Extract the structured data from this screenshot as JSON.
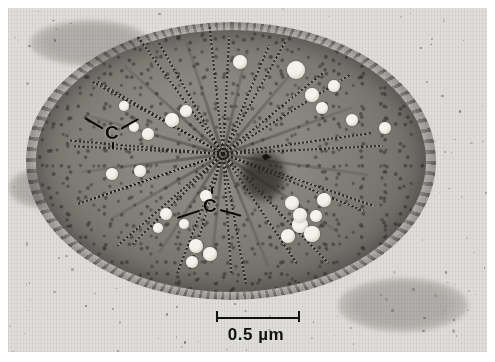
{
  "figure": {
    "kind": "transmission-electron-micrograph",
    "background_color": "#dcdbd7",
    "plate": {
      "x": 8,
      "y": 8,
      "width": 479,
      "height": 344
    }
  },
  "annotations": {
    "labels": [
      {
        "id": "c-upper",
        "text": "C",
        "x": 105,
        "y": 123,
        "font_size": 19,
        "leaders": [
          {
            "angle_deg": 150,
            "length": 21
          },
          {
            "angle_deg": 30,
            "length": 20
          }
        ],
        "tick": {
          "dx": 7,
          "dy": 19
        }
      },
      {
        "id": "c-lower",
        "text": "C",
        "x": 203,
        "y": 196,
        "font_size": 19,
        "leaders": [
          {
            "angle_deg": 198,
            "length": 24
          },
          {
            "angle_deg": 345,
            "length": 22
          }
        ],
        "tick": {
          "dx": 8,
          "dy": -9
        }
      }
    ]
  },
  "scale_bar": {
    "label": "0.5 µm",
    "value": 0.5,
    "unit": "µm",
    "bar_x_start": 208,
    "bar_x_end": 292,
    "bar_y": 317,
    "color": "#111111",
    "has_end_caps": true
  },
  "cell": {
    "center_x": 223,
    "center_y": 153,
    "radius_x": 195,
    "radius_y": 131,
    "cytoplasm_color": "#7d7a73",
    "coat_color": "#3c3a36",
    "description": "ellipsoidal cell with radiating wedge-shaped chlorosome arrays converging toward the centre, numerous bright storage globules, and a fuzzy granular surface coat",
    "wedges": [
      {
        "angle_deg": 196,
        "length": 150,
        "spread": 13
      },
      {
        "angle_deg": 173,
        "length": 155,
        "spread": 12
      },
      {
        "angle_deg": 150,
        "length": 140,
        "spread": 11
      },
      {
        "angle_deg": 123,
        "length": 128,
        "spread": 12
      },
      {
        "angle_deg": 96,
        "length": 120,
        "spread": 10
      },
      {
        "angle_deg": 68,
        "length": 132,
        "spread": 12
      },
      {
        "angle_deg": 34,
        "length": 152,
        "spread": 12
      },
      {
        "angle_deg": 8,
        "length": 160,
        "spread": 11
      },
      {
        "angle_deg": 340,
        "length": 150,
        "spread": 12
      },
      {
        "angle_deg": 310,
        "length": 130,
        "spread": 11
      },
      {
        "angle_deg": 283,
        "length": 118,
        "spread": 10
      },
      {
        "angle_deg": 252,
        "length": 128,
        "spread": 12
      },
      {
        "angle_deg": 222,
        "length": 145,
        "spread": 12
      }
    ],
    "globules": [
      {
        "x": 240,
        "y": 62,
        "r": 7
      },
      {
        "x": 296,
        "y": 70,
        "r": 9
      },
      {
        "x": 312,
        "y": 95,
        "r": 7
      },
      {
        "x": 322,
        "y": 108,
        "r": 6
      },
      {
        "x": 352,
        "y": 120,
        "r": 6
      },
      {
        "x": 385,
        "y": 128,
        "r": 6
      },
      {
        "x": 172,
        "y": 120,
        "r": 7
      },
      {
        "x": 186,
        "y": 111,
        "r": 6
      },
      {
        "x": 134,
        "y": 127,
        "r": 5
      },
      {
        "x": 148,
        "y": 134,
        "r": 6
      },
      {
        "x": 112,
        "y": 174,
        "r": 6
      },
      {
        "x": 140,
        "y": 171,
        "r": 6
      },
      {
        "x": 166,
        "y": 214,
        "r": 6
      },
      {
        "x": 184,
        "y": 224,
        "r": 5
      },
      {
        "x": 158,
        "y": 228,
        "r": 5
      },
      {
        "x": 196,
        "y": 246,
        "r": 7
      },
      {
        "x": 210,
        "y": 254,
        "r": 7
      },
      {
        "x": 192,
        "y": 262,
        "r": 6
      },
      {
        "x": 206,
        "y": 196,
        "r": 6
      },
      {
        "x": 292,
        "y": 203,
        "r": 7
      },
      {
        "x": 300,
        "y": 225,
        "r": 8
      },
      {
        "x": 312,
        "y": 234,
        "r": 8
      },
      {
        "x": 288,
        "y": 236,
        "r": 7
      },
      {
        "x": 324,
        "y": 200,
        "r": 7
      },
      {
        "x": 300,
        "y": 215,
        "r": 7
      },
      {
        "x": 316,
        "y": 216,
        "r": 6
      },
      {
        "x": 334,
        "y": 86,
        "r": 6
      },
      {
        "x": 124,
        "y": 106,
        "r": 5
      }
    ],
    "dark_spot": {
      "x": 266,
      "y": 157,
      "width": 9,
      "height": 7
    },
    "dark_patch": {
      "x": 263,
      "y": 176,
      "width": 46,
      "height": 52
    }
  }
}
